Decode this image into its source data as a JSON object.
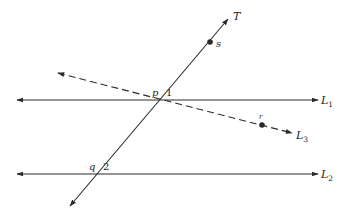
{
  "diagram": {
    "title": "",
    "lines": [
      {
        "id": "L1",
        "label": "L",
        "subscript": "1",
        "style": "solid",
        "x1": 17,
        "y1": 100,
        "x2": 318,
        "y2": 100,
        "label_x": 321,
        "label_y": 104
      },
      {
        "id": "L2",
        "label": "L",
        "subscript": "2",
        "style": "solid",
        "x1": 17,
        "y1": 174,
        "x2": 318,
        "y2": 174,
        "label_x": 321,
        "label_y": 178
      },
      {
        "id": "L3",
        "label": "L",
        "subscript": "3",
        "style": "dashed",
        "x1": 58,
        "y1": 73,
        "x2": 292,
        "y2": 133,
        "label_x": 296,
        "label_y": 139
      },
      {
        "id": "T",
        "label": "T",
        "subscript": "",
        "style": "solid",
        "x1": 70,
        "y1": 206,
        "x2": 228,
        "y2": 19,
        "label_x": 233,
        "label_y": 20
      }
    ],
    "points": [
      {
        "id": "s",
        "label": "s",
        "x": 210,
        "y": 42,
        "dot": true,
        "label_x": 216,
        "label_y": 47
      },
      {
        "id": "r",
        "label": "r",
        "x": 262,
        "y": 125,
        "dot": true,
        "label_x": 259,
        "label_y": 119
      },
      {
        "id": "p",
        "label": "p",
        "x": 160,
        "y": 100,
        "dot": false,
        "label_x": 152,
        "label_y": 96
      },
      {
        "id": "q",
        "label": "q",
        "x": 98,
        "y": 174,
        "dot": false,
        "label_x": 89,
        "label_y": 170
      }
    ],
    "angles": [
      {
        "id": "angle-1",
        "label": "1",
        "x": 166,
        "y": 96
      },
      {
        "id": "angle-2",
        "label": "2",
        "x": 103,
        "y": 170
      }
    ],
    "colors": {
      "stroke": "#2a2a2a",
      "background": "#ffffff"
    }
  }
}
